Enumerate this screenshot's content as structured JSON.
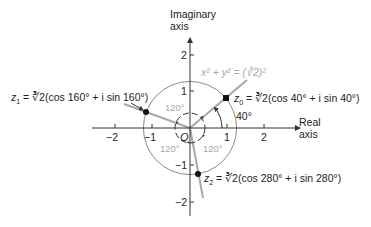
{
  "axes": {
    "imag_label_line1": "Imaginary",
    "imag_label_line2": "axis",
    "real_label_line1": "Real",
    "real_label_line2": "axis",
    "x_ticks": [
      "−2",
      "−1",
      "1",
      "2"
    ],
    "y_ticks": [
      "2",
      "1",
      "−1",
      "−2"
    ],
    "origin": "O"
  },
  "circle": {
    "equation": "x² + y² = (∛2)²"
  },
  "points": {
    "z0": {
      "name": "z",
      "sub": "0",
      "expr": " = ∛2(cos 40° + i sin 40°)",
      "angle": 40
    },
    "z1": {
      "name": "z",
      "sub": "1",
      "expr": " = ∛2(cos 160° + i sin 160°)",
      "angle": 160
    },
    "z2": {
      "name": "z",
      "sub": "2",
      "expr": " = ∛2(cos 280° + i sin 280°)",
      "angle": 280
    }
  },
  "angles": {
    "a40": "40°",
    "a120_top": "120°",
    "a120_left": "120°",
    "a120_right": "120°"
  },
  "colors": {
    "axis": "#333333",
    "circle": "#8a8a8a",
    "rays": "#a0a0a0",
    "text_gray": "#a8a8a8"
  }
}
